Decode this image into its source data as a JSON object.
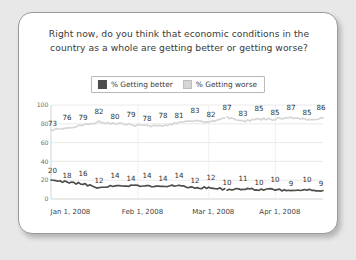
{
  "card": {
    "title_line1": "Right now, do you think that economic conditions in the",
    "title_line2": "country as a whole are getting better or getting worse?"
  },
  "legend": {
    "better_label": "% Getting better",
    "worse_label": "% Getting worse",
    "better_color": "#4d4d4d",
    "worse_color": "#d6d6d6"
  },
  "chart_data": {
    "type": "line",
    "title": "Right now, do you think that economic conditions in the country as a whole are getting better or getting worse?",
    "xlabel": "",
    "ylabel": "",
    "ylim": [
      0,
      100
    ],
    "yticks": [
      0,
      20,
      40,
      60,
      80,
      100
    ],
    "ytick_labels": [
      "0",
      "20",
      "40",
      "60",
      "80",
      "100"
    ],
    "grid": true,
    "legend_position": "top-center",
    "x_tick_labels": [
      "Jan 1, 2008",
      "Feb 1, 2008",
      "Mar 1, 2008",
      "Apr 1, 2008"
    ],
    "x_tick_positions": [
      0.02,
      0.285,
      0.545,
      0.79
    ],
    "series": [
      {
        "name": "% Getting worse",
        "color": "#d6d6d6",
        "labels": [
          73,
          76,
          79,
          82,
          80,
          79,
          78,
          78,
          81,
          83,
          82,
          87,
          83,
          85,
          85,
          87,
          85,
          86
        ]
      },
      {
        "name": "% Getting better",
        "color": "#4d4d4d",
        "labels": [
          20,
          18,
          16,
          12,
          14,
          14,
          14,
          14,
          14,
          12,
          12,
          10,
          11,
          10,
          10,
          9,
          10,
          9
        ]
      }
    ]
  }
}
